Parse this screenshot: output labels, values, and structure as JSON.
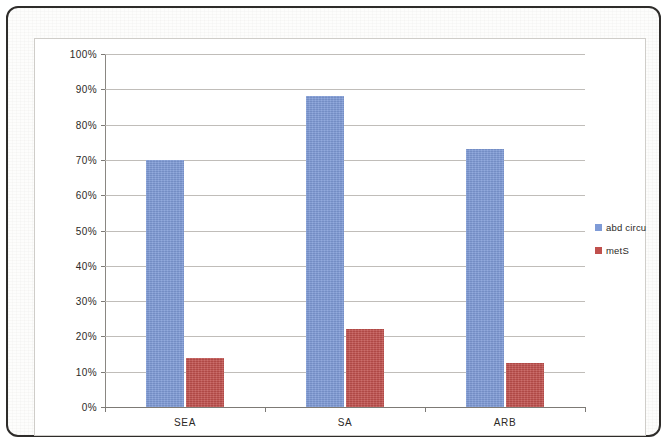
{
  "chart_data": {
    "type": "bar",
    "title": "",
    "xlabel": "",
    "ylabel": "",
    "categories": [
      "SEA",
      "SA",
      "ARB"
    ],
    "series": [
      {
        "name": "abd circu",
        "color": "#7f9bd7",
        "values": [
          70,
          88,
          73
        ]
      },
      {
        "name": "metS",
        "color": "#c0504d",
        "values": [
          14,
          22,
          12.5
        ]
      }
    ],
    "ylim": [
      0,
      100
    ],
    "ytick_values": [
      0,
      10,
      20,
      30,
      40,
      50,
      60,
      70,
      80,
      90,
      100
    ],
    "ytick_labels": [
      "0%",
      "10%",
      "20%",
      "30%",
      "40%",
      "50%",
      "60%",
      "70%",
      "80%",
      "90%",
      "100%"
    ],
    "grid": true,
    "legend_position": "right"
  }
}
